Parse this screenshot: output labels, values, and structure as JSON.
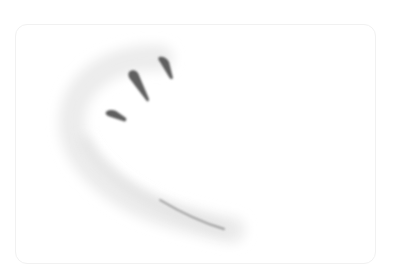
{
  "card": {
    "illustration": {
      "icon": "brush-stroke-arc-icon",
      "stroke_color": "#5a5a5a",
      "wash_color": "#e9e9e9"
    }
  }
}
